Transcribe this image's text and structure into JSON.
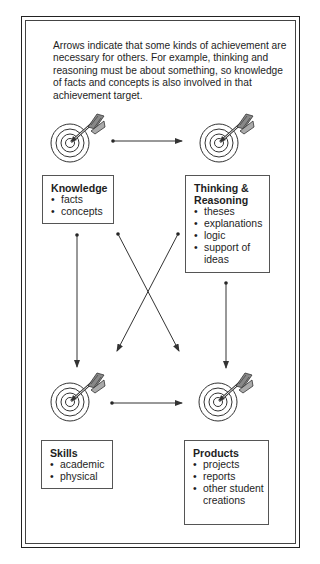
{
  "intro_text": "Arrows indicate that some kinds of achievement are necessary for others. For example, thinking and reasoning must be about something, so knowledge of facts and concepts is also involved in that achievement target.",
  "nodes": [
    {
      "id": "knowledge",
      "title": "Knowledge",
      "items": [
        "facts",
        "concepts"
      ],
      "icon": "target-icon"
    },
    {
      "id": "thinking",
      "title": "Thinking & Reasoning",
      "items": [
        "theses",
        "explanations",
        "logic",
        "support of ideas"
      ],
      "icon": "target-icon"
    },
    {
      "id": "skills",
      "title": "Skills",
      "items": [
        "academic",
        "physical"
      ],
      "icon": "target-icon"
    },
    {
      "id": "products",
      "title": "Products",
      "items": [
        "projects",
        "reports",
        "other student creations"
      ],
      "icon": "target-icon"
    }
  ],
  "edges": [
    {
      "from": "knowledge",
      "to": "thinking"
    },
    {
      "from": "knowledge",
      "to": "skills"
    },
    {
      "from": "knowledge",
      "to": "products"
    },
    {
      "from": "thinking",
      "to": "skills"
    },
    {
      "from": "thinking",
      "to": "products"
    },
    {
      "from": "skills",
      "to": "products"
    }
  ],
  "colors": {
    "line": "#333333",
    "border": "#222222",
    "background": "#ffffff"
  }
}
